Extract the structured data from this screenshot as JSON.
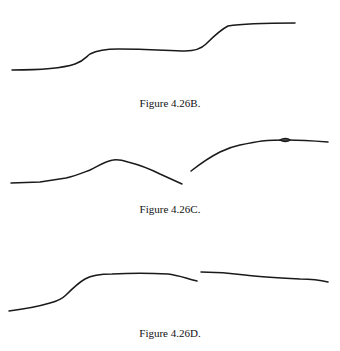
{
  "figures": [
    {
      "id": "B",
      "caption": "Figure 4.26B."
    },
    {
      "id": "C",
      "caption": "Figure 4.26C."
    },
    {
      "id": "D",
      "caption": "Figure 4.26D."
    }
  ]
}
